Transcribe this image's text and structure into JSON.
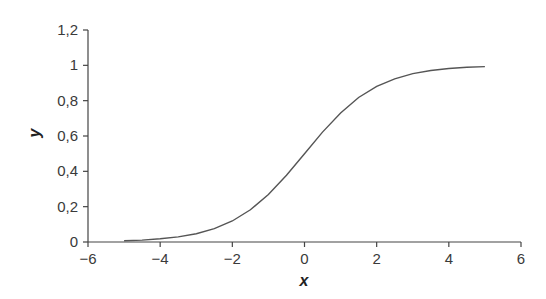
{
  "chart_data": {
    "type": "line",
    "title": "",
    "xlabel": "x",
    "ylabel": "y",
    "xlim": [
      -6,
      6
    ],
    "ylim": [
      0,
      1.2
    ],
    "grid": false,
    "legend": null,
    "x_ticks": [
      "−6",
      "−4",
      "−2",
      "0",
      "2",
      "4",
      "6"
    ],
    "y_ticks": [
      "0",
      "0,2",
      "0,4",
      "0,6",
      "0,8",
      "1",
      "1,2"
    ],
    "series": [
      {
        "name": "sigmoid",
        "color": "#555555",
        "x": [
          -5,
          -4.5,
          -4,
          -3.5,
          -3,
          -2.5,
          -2,
          -1.5,
          -1,
          -0.5,
          0,
          0.5,
          1,
          1.5,
          2,
          2.5,
          3,
          3.5,
          4,
          4.5,
          5
        ],
        "y": [
          0.007,
          0.011,
          0.018,
          0.029,
          0.047,
          0.076,
          0.119,
          0.182,
          0.269,
          0.378,
          0.5,
          0.622,
          0.731,
          0.818,
          0.881,
          0.924,
          0.953,
          0.971,
          0.982,
          0.989,
          0.993
        ]
      }
    ]
  }
}
